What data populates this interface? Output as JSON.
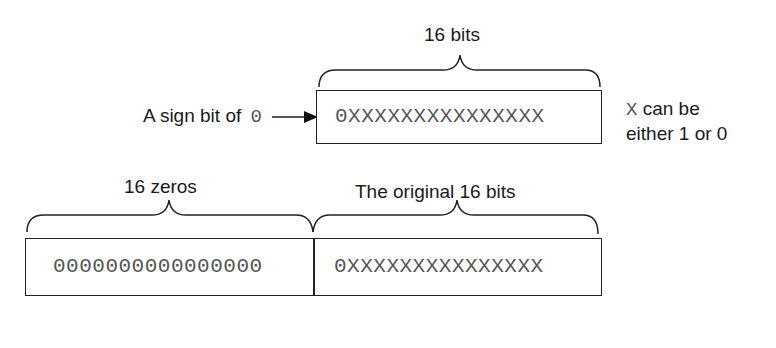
{
  "top_register": {
    "brace_label": "16 bits",
    "contents": "0XXXXXXXXXXXXXXX",
    "sign_label": "A sign bit of",
    "sign_value": "0",
    "note_symbol": "X",
    "note_line1": "can be",
    "note_line2": "either 1 or 0"
  },
  "bottom_register": {
    "left_brace_label": "16 zeros",
    "left_contents": "0000000000000000",
    "right_brace_label": "The original 16 bits",
    "right_contents": "0XXXXXXXXXXXXXXX"
  },
  "colors": {
    "line": "#222222",
    "text": "#1a1a1a",
    "bit_text": "#555555"
  }
}
